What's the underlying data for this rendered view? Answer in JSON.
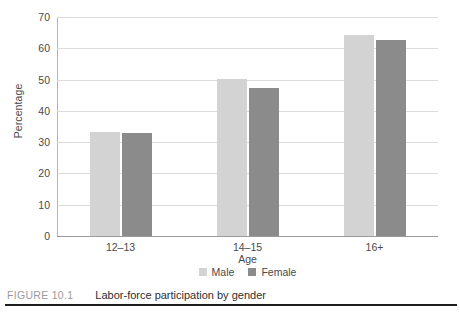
{
  "caption": {
    "number": "FIGURE 10.1",
    "title": "Labor-force participation by gender"
  },
  "chart_data": {
    "type": "bar",
    "title": "Labor-force participation by gender",
    "xlabel": "Age",
    "ylabel": "Percentage",
    "categories": [
      "12–13",
      "14–15",
      "16+"
    ],
    "series": [
      {
        "name": "Male",
        "color": "#d3d3d3",
        "values": [
          33.2,
          50.3,
          64.3
        ]
      },
      {
        "name": "Female",
        "color": "#8b8b8b",
        "values": [
          32.8,
          47.4,
          62.6
        ]
      }
    ],
    "ylim": [
      0,
      70
    ],
    "yticks": [
      0,
      10,
      20,
      30,
      40,
      50,
      60,
      70
    ],
    "ytick_labels": [
      "0",
      "10",
      "20",
      "30",
      "40",
      "50",
      "60",
      "70"
    ],
    "grid": true,
    "legend_position": "bottom-center"
  }
}
